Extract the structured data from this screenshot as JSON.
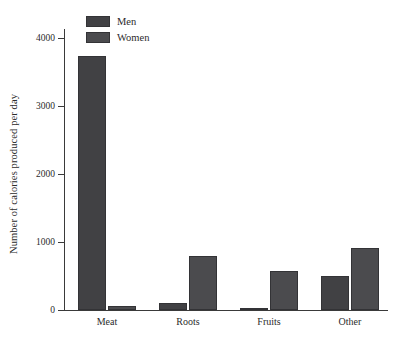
{
  "chart_data": {
    "type": "bar",
    "title": "",
    "xlabel": "",
    "ylabel": "Number of calories produced per day",
    "categories": [
      "Meat",
      "Roots",
      "Fruits",
      "Other"
    ],
    "series": [
      {
        "name": "Men",
        "values": [
          3730,
          100,
          30,
          500
        ],
        "color": "#414144"
      },
      {
        "name": "Women",
        "values": [
          55,
          800,
          570,
          910
        ],
        "color": "#4b4b4e"
      }
    ],
    "yticks": [
      0,
      1000,
      2000,
      3000,
      4000
    ],
    "ytick_labels": [
      "0",
      "1000",
      "2000",
      "3000",
      "4000"
    ],
    "ylim": [
      0,
      4000
    ],
    "y_axis_top_value": 4130,
    "grid": false,
    "legend_position": "upper center-left",
    "legend_entries": [
      "Men",
      "Women"
    ],
    "spines": [
      "left",
      "bottom"
    ],
    "bar_group_layout": "grouped"
  },
  "axes": {
    "y_title": "Number of calories produced per day",
    "ytick_0": "0",
    "ytick_1": "1000",
    "ytick_2": "2000",
    "ytick_3": "3000",
    "ytick_4": "4000",
    "xtick_0": "Meat",
    "xtick_1": "Roots",
    "xtick_2": "Fruits",
    "xtick_3": "Other"
  },
  "legend": {
    "men_label": "Men",
    "women_label": "Women"
  }
}
